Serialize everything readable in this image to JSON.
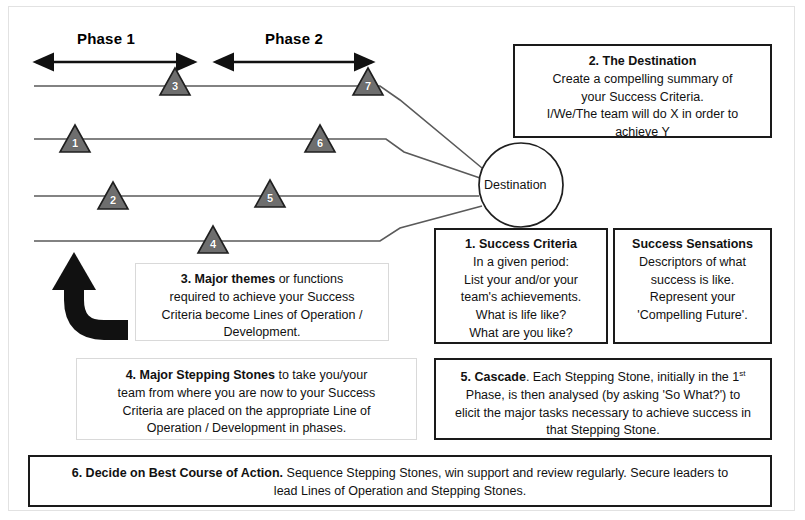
{
  "diagram": {
    "title_hidden": "",
    "phases": [
      {
        "label": "Phase 1"
      },
      {
        "label": "Phase 2"
      }
    ],
    "destination_node": {
      "label": "Destination"
    },
    "stepping_stones": [
      {
        "number": "3"
      },
      {
        "number": "7"
      },
      {
        "number": "1"
      },
      {
        "number": "6"
      },
      {
        "number": "2"
      },
      {
        "number": "5"
      },
      {
        "number": "4"
      }
    ],
    "colors": {
      "stone_fill": "#6e6e6e",
      "stone_stroke": "#1f1f1f",
      "line": "#5a5a5a",
      "box_border": "#1a1a1a",
      "frame_border": "#e2e2e2",
      "arrow": "#111111",
      "thick_arrow": "#111111"
    },
    "boxes": {
      "destination": {
        "heading": "2.  The Destination",
        "lines": [
          "Create a compelling summary of",
          "your Success Criteria.",
          "I/We/The team will do X in order to",
          "achieve Y"
        ]
      },
      "success_criteria": {
        "heading": "1. Success Criteria",
        "lines": [
          "In a given period:",
          "List your and/or your",
          "team's achievements.",
          "What is life like?",
          "What are you like?"
        ]
      },
      "success_sensations": {
        "heading": "Success Sensations",
        "lines": [
          "Descriptors of what",
          "success is like.",
          "Represent your",
          "'Compelling Future'."
        ]
      },
      "major_themes": {
        "lead": "3. Major themes",
        "rest_first_line": " or functions",
        "lines": [
          "required to achieve your Success",
          "Criteria become Lines of Operation /",
          "Development."
        ]
      },
      "major_stepping_stones": {
        "lead": "4. Major Stepping Stones",
        "rest_first_line": " to take you/your",
        "lines": [
          "team from where you are now to your Success",
          "Criteria are placed on the appropriate Line of",
          "Operation / Development in phases."
        ]
      },
      "cascade": {
        "lead": "5. Cascade",
        "rest_first_line": ". Each Stepping Stone, initially in the 1st",
        "lines": [
          "Phase, is then analysed (by asking 'So What?') to",
          "elicit the major tasks necessary to achieve success in",
          "that Stepping Stone."
        ]
      },
      "best_course_of_action": {
        "lead": "6. Decide on Best Course of Action.",
        "rest_first_line": "  Sequence Stepping Stones, win support and review regularly.  Secure leaders to",
        "lines": [
          "lead Lines of Operation and Stepping Stones."
        ]
      }
    }
  }
}
